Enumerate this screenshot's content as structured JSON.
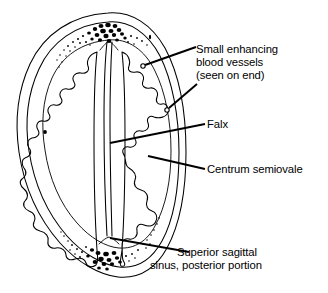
{
  "figure": {
    "background_color": "#ffffff",
    "ink_color": "#000000",
    "width": 328,
    "height": 293
  },
  "labels": {
    "blood_vessels": {
      "line1": "Small enhancing",
      "line2": "blood vessels",
      "line3": "(seen on end)"
    },
    "falx": "Falx",
    "centrum_semiovale": "Centrum semiovale",
    "superior_sagittal_sinus": {
      "line1": "Superior sagittal",
      "line2": "sinus, posterior portion"
    }
  },
  "anatomy": {
    "skull_outer": "outer cranial vault outline",
    "skull_inner": "inner table of skull outline",
    "diploe_superior": "stippled diploic marrow, anterior/superior",
    "diploe_inferior": "stippled diploic marrow, posterior/inferior",
    "falx_cerebri": "midline vertical falx band",
    "gyri_left": "left hemisphere gyral pattern",
    "gyri_right": "right hemisphere gyral pattern",
    "vessel_marks": "small circles denoting vessels seen on end",
    "marker_dot": "small solid dot at left periphery"
  }
}
